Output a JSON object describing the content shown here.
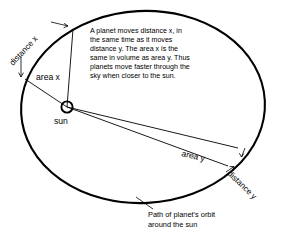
{
  "diagram": {
    "background_color": "#ffffff",
    "ink_color": "#000000",
    "body_text": {
      "lines": [
        "A planet moves distance x, in",
        "the same time as it moves",
        "distance y. The area x is the",
        "same in volume as area y. Thus",
        "planets move faster through the",
        "sky when closer to the sun."
      ]
    },
    "labels": {
      "distance_x": "distance x",
      "distance_y": "distance y",
      "area_x": "area x",
      "area_y": "area y",
      "sun": "sun"
    },
    "caption": {
      "line1": "Path of planet's orbit",
      "line2": "around the sun"
    },
    "icons": {
      "sun_marker": "sun-circle-icon",
      "arrow_marker": "arrow-tick-icon"
    }
  }
}
